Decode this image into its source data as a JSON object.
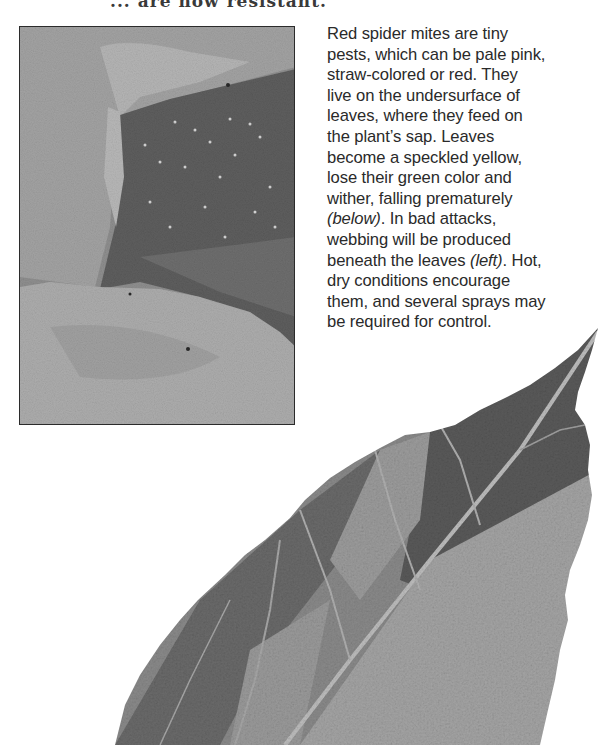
{
  "page": {
    "heading_fragment": "... are now resistant.",
    "paragraph": {
      "lines": [
        {
          "text": "Red spider mites are tiny"
        },
        {
          "text": "pests, which can be pale pink,"
        },
        {
          "text": "straw-colored or red. They"
        },
        {
          "text": "live on the undersurface of"
        },
        {
          "text": "leaves, where they feed on"
        },
        {
          "text": "the plant’s sap. Leaves"
        },
        {
          "text": "become a speckled yellow,"
        },
        {
          "text": "lose their green color and"
        },
        {
          "text": "wither, falling prematurely"
        },
        {
          "pre": "",
          "italic": "(below)",
          "post": ". In bad attacks,"
        },
        {
          "text": "webbing will be produced"
        },
        {
          "pre": "beneath the leaves ",
          "italic": "(left)",
          "post": ". Hot,"
        },
        {
          "text": "dry conditions encourage"
        },
        {
          "text": "them, and several sprays may"
        },
        {
          "text": "be required for control."
        }
      ]
    },
    "figures": {
      "webbing_photo": {
        "label": "Red spider mite webbing beneath leaves (grayscale photo)"
      },
      "damaged_leaf": {
        "label": "Leaf speckled and discolored by red spider mites (grayscale photo)"
      }
    }
  },
  "colors": {
    "text": "#2a2a2a",
    "background": "#ffffff",
    "photo_border": "#2b2b2b"
  }
}
